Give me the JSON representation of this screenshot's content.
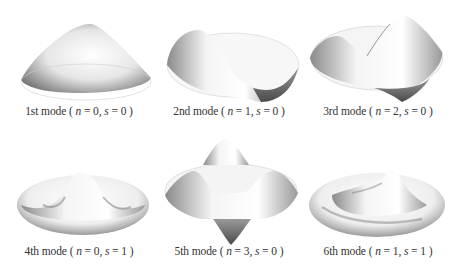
{
  "figure": {
    "modes": [
      {
        "label": "1st mode",
        "n": "0",
        "s": "0"
      },
      {
        "label": "2nd mode",
        "n": "1",
        "s": "0"
      },
      {
        "label": "3rd mode",
        "n": "2",
        "s": "0"
      },
      {
        "label": "4th mode",
        "n": "0",
        "s": "1"
      },
      {
        "label": "5th mode",
        "n": "3",
        "s": "0"
      },
      {
        "label": "6th mode",
        "n": "1",
        "s": "1"
      }
    ],
    "symbols": {
      "n": "n",
      "s": "s",
      "eq": " = ",
      "open": " ( ",
      "close": " )",
      "sep": ", "
    }
  }
}
